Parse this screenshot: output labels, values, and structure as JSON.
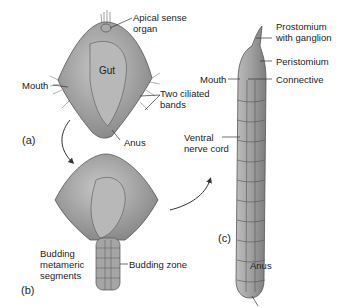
{
  "figure": {
    "panels": {
      "a": "(a)",
      "b": "(b)",
      "c": "(c)"
    },
    "labels": {
      "apical_sense_organ_1": "Apical sense",
      "apical_sense_organ_2": "organ",
      "gut": "Gut",
      "mouth_a": "Mouth",
      "two_ciliated_bands_1": "Two ciliated",
      "two_ciliated_bands_2": "bands",
      "anus_a": "Anus",
      "budding_metameric_segments_1": "Budding",
      "budding_metameric_segments_2": "metameric",
      "budding_metameric_segments_3": "segments",
      "budding_zone": "Budding zone",
      "prostomium_1": "Prostomium",
      "prostomium_2": "with ganglion",
      "peristomium": "Peristomium",
      "mouth_c": "Mouth",
      "connective": "Connective",
      "ventral_nerve_cord_1": "Ventral",
      "ventral_nerve_cord_2": "nerve cord",
      "anus_c": "Anus"
    },
    "colors": {
      "body_fill": "#9a9a9a",
      "body_light": "#c4c4c4",
      "outline": "#4a4a4a",
      "text": "#222222",
      "arrow": "#333333"
    }
  }
}
